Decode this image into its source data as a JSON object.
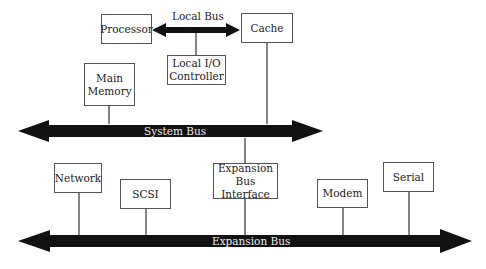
{
  "diagram": {
    "local_bus": {
      "label": "Local Bus"
    },
    "system_bus": {
      "label": "System Bus"
    },
    "expansion_bus": {
      "label": "Expansion Bus"
    },
    "components": {
      "processor": "Processor",
      "cache": "Cache",
      "local_io_line1": "Local I/O",
      "local_io_line2": "Controller",
      "main_memory_line1": "Main",
      "main_memory_line2": "Memory",
      "expansion_interface_line1": "Expansion",
      "expansion_interface_line2": "Bus Interface",
      "network": "Network",
      "scsi": "SCSI",
      "modem": "Modem",
      "serial": "Serial"
    },
    "colors": {
      "bus": "#111111",
      "box_border": "#555555",
      "line": "#333333"
    }
  }
}
